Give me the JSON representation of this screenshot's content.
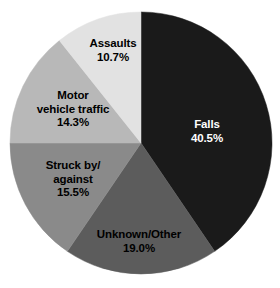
{
  "background_color": "#ffffff",
  "chart_data": {
    "type": "pie",
    "title": "",
    "subtitle": "",
    "xlabel": "",
    "ylabel": "",
    "legend": "none",
    "grid": false,
    "units": "percent",
    "start_angle_deg": 0,
    "direction": "clockwise",
    "center": {
      "x": 141,
      "y": 143
    },
    "radius": 131,
    "categories": [
      "Falls",
      "Unknown/Other",
      "Struck by/against",
      "Motor vehicle traffic",
      "Assaults"
    ],
    "values": [
      40.5,
      19.0,
      15.5,
      14.3,
      10.7
    ],
    "slices": [
      {
        "name": "Falls",
        "label_lines": [
          "Falls"
        ],
        "value": 40.5,
        "value_label": "40.5%",
        "color": "#1a1a1a",
        "text_color": "#ffffff"
      },
      {
        "name": "Unknown/Other",
        "label_lines": [
          "Unknown/Other"
        ],
        "value": 19.0,
        "value_label": "19.0%",
        "color": "#5c5c5c",
        "text_color": "#000000"
      },
      {
        "name": "Struck by/against",
        "label_lines": [
          "Struck by/",
          "against"
        ],
        "value": 15.5,
        "value_label": "15.5%",
        "color": "#8a8a8a",
        "text_color": "#000000"
      },
      {
        "name": "Motor vehicle traffic",
        "label_lines": [
          "Motor",
          "vehicle traffic"
        ],
        "value": 14.3,
        "value_label": "14.3%",
        "color": "#b8b8b8",
        "text_color": "#000000"
      },
      {
        "name": "Assaults",
        "label_lines": [
          "Assaults"
        ],
        "value": 10.7,
        "value_label": "10.7%",
        "color": "#e2e2e2",
        "text_color": "#000000"
      }
    ]
  },
  "labels": {
    "falls": {
      "line1": "Falls",
      "value": "40.5%"
    },
    "unknown": {
      "line1": "Unknown/Other",
      "value": "19.0%"
    },
    "struck": {
      "line1": "Struck by/",
      "line2": "against",
      "value": "15.5%"
    },
    "motor": {
      "line1": "Motor",
      "line2": "vehicle traffic",
      "value": "14.3%"
    },
    "assaults": {
      "line1": "Assaults",
      "value": "10.7%"
    }
  }
}
